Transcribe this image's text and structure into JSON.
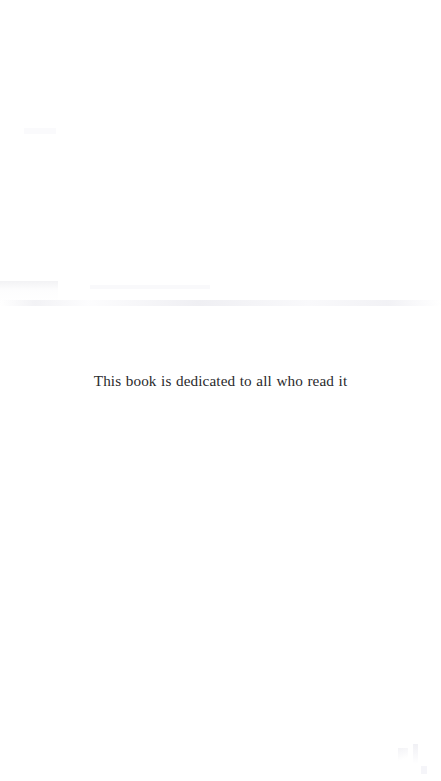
{
  "page": {
    "kind": "scanned-book-dedication-page",
    "background_color": "#ffffff",
    "width": 441,
    "height": 781
  },
  "dedication": {
    "text": "This book is dedicated to all who read it",
    "text_color": "#2a2a2c",
    "alignment": "center"
  },
  "artifacts": {
    "description": "faint scanner noise",
    "color": "#f2f2f6"
  }
}
